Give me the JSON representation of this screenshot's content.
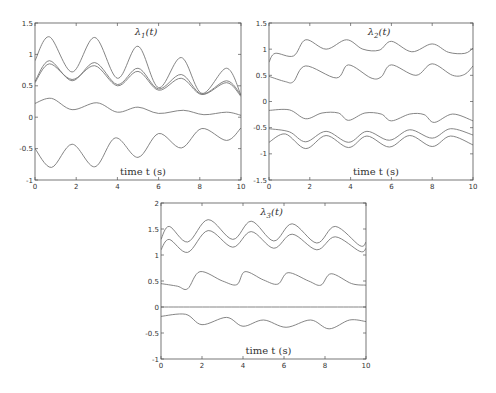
{
  "chart_data": [
    {
      "id": "lambda1",
      "type": "line",
      "title": "λ1(t)",
      "title_main": "λ",
      "title_sub": "1",
      "title_tail": "(t)",
      "xlabel": "time t (s)",
      "ylabel": "",
      "xlim": [
        0,
        10
      ],
      "ylim": [
        -1,
        1.5
      ],
      "xticks": [
        0,
        2,
        4,
        6,
        8,
        10
      ],
      "yticks": [
        -1,
        -0.5,
        0,
        0.5,
        1,
        1.5
      ],
      "ytick_labels": [
        "-1",
        "-0.5",
        "0",
        "0.5",
        "1",
        "1.5"
      ],
      "grid": false,
      "box": {
        "x": 35,
        "y": 23,
        "w": 206,
        "h": 157
      },
      "series": [
        {
          "name": "curve1",
          "x": [
            0,
            0.7,
            1.8,
            2.9,
            4.0,
            5.0,
            6.0,
            7.1,
            8.1,
            9.3,
            10
          ],
          "y": [
            0.9,
            1.28,
            0.72,
            1.27,
            0.62,
            1.13,
            0.47,
            0.95,
            0.38,
            0.78,
            0.35
          ]
        },
        {
          "name": "curve2",
          "x": [
            0,
            0.7,
            1.8,
            2.9,
            4.0,
            5.0,
            6.0,
            7.1,
            8.1,
            9.3,
            10
          ],
          "y": [
            0.57,
            0.9,
            0.58,
            0.87,
            0.52,
            0.78,
            0.45,
            0.68,
            0.37,
            0.58,
            0.35
          ]
        },
        {
          "name": "curve3",
          "x": [
            0,
            0.7,
            1.8,
            2.9,
            4.0,
            5.0,
            6.0,
            7.1,
            8.1,
            9.3,
            10
          ],
          "y": [
            0.55,
            0.85,
            0.6,
            0.82,
            0.5,
            0.73,
            0.43,
            0.62,
            0.36,
            0.55,
            0.33
          ]
        },
        {
          "name": "curve4",
          "x": [
            0,
            0.8,
            1.8,
            3.0,
            4.0,
            5.0,
            6.0,
            7.2,
            8.2,
            9.3,
            10
          ],
          "y": [
            0.22,
            0.3,
            0.12,
            0.23,
            0.08,
            0.16,
            0.06,
            0.11,
            0.04,
            0.08,
            0.03
          ]
        },
        {
          "name": "curve5",
          "x": [
            0,
            0.8,
            1.8,
            2.9,
            3.9,
            5.0,
            6.0,
            7.1,
            8.1,
            9.3,
            10
          ],
          "y": [
            -0.5,
            -0.8,
            -0.43,
            -0.79,
            -0.33,
            -0.64,
            -0.26,
            -0.49,
            -0.18,
            -0.37,
            -0.17
          ]
        }
      ]
    },
    {
      "id": "lambda2",
      "type": "line",
      "title": "λ2(t)",
      "title_main": "λ",
      "title_sub": "2",
      "title_tail": "(t)",
      "xlabel": "time t (s)",
      "ylabel": "",
      "xlim": [
        0,
        10
      ],
      "ylim": [
        -1.5,
        1.5
      ],
      "xticks": [
        0,
        2,
        4,
        6,
        8,
        10
      ],
      "yticks": [
        -1.5,
        -1,
        -0.5,
        0,
        0.5,
        1,
        1.5
      ],
      "ytick_labels": [
        "-1.5",
        "-1",
        "-0.5",
        "0",
        "0.5",
        "1",
        "1.5"
      ],
      "grid": false,
      "box": {
        "x": 269,
        "y": 23,
        "w": 204,
        "h": 157
      },
      "series": [
        {
          "name": "curve1",
          "x": [
            0,
            0.3,
            1.2,
            1.8,
            2.8,
            3.8,
            4.6,
            5.4,
            6.0,
            7.0,
            8.0,
            8.8,
            9.6,
            10
          ],
          "y": [
            0.75,
            0.92,
            0.87,
            1.18,
            1.0,
            1.18,
            1.0,
            0.98,
            1.15,
            0.95,
            1.1,
            0.94,
            0.92,
            1.02
          ]
        },
        {
          "name": "curve2",
          "x": [
            0,
            0.8,
            1.2,
            1.8,
            3.3,
            3.9,
            5.0,
            5.5,
            6.0,
            7.2,
            8.0,
            9.0,
            9.6,
            10
          ],
          "y": [
            0.48,
            0.38,
            0.38,
            0.68,
            0.45,
            0.7,
            0.45,
            0.47,
            0.7,
            0.5,
            0.72,
            0.5,
            0.52,
            0.68
          ]
        },
        {
          "name": "curve3",
          "x": [
            0,
            1.0,
            1.8,
            2.6,
            3.4,
            3.9,
            4.7,
            5.5,
            6.0,
            6.9,
            7.6,
            8.1,
            9.0,
            10
          ],
          "y": [
            -0.17,
            -0.16,
            -0.33,
            -0.22,
            -0.22,
            -0.36,
            -0.22,
            -0.24,
            -0.37,
            -0.24,
            -0.25,
            -0.4,
            -0.24,
            -0.37
          ]
        },
        {
          "name": "curve4",
          "x": [
            0,
            1.0,
            1.8,
            2.8,
            3.9,
            4.8,
            5.9,
            6.9,
            8.0,
            8.9,
            10
          ],
          "y": [
            -0.52,
            -0.58,
            -0.77,
            -0.57,
            -0.78,
            -0.57,
            -0.74,
            -0.54,
            -0.7,
            -0.52,
            -0.64
          ]
        },
        {
          "name": "curve5",
          "x": [
            0,
            0.8,
            1.8,
            2.8,
            3.9,
            4.8,
            5.9,
            6.9,
            8.0,
            8.9,
            10
          ],
          "y": [
            -0.78,
            -0.62,
            -0.9,
            -0.65,
            -0.88,
            -0.66,
            -0.87,
            -0.65,
            -0.86,
            -0.66,
            -0.83
          ]
        }
      ]
    },
    {
      "id": "lambda3",
      "type": "line",
      "title": "λ3(t)",
      "title_main": "λ",
      "title_sub": "3",
      "title_tail": "(t)",
      "xlabel": "time t (s)",
      "ylabel": "",
      "xlim": [
        0,
        10
      ],
      "ylim": [
        -1,
        2
      ],
      "xticks": [
        0,
        2,
        4,
        6,
        8,
        10
      ],
      "yticks": [
        -1,
        -0.5,
        0,
        0.5,
        1,
        1.5,
        2
      ],
      "ytick_labels": [
        "-1",
        "-0.5",
        "0",
        "0.5",
        "1",
        "1.5",
        "2"
      ],
      "grid": false,
      "box": {
        "x": 161,
        "y": 203,
        "w": 205,
        "h": 156
      },
      "series": [
        {
          "name": "curve1",
          "x": [
            0,
            0.4,
            1.3,
            2.3,
            3.5,
            4.4,
            5.5,
            6.4,
            7.6,
            8.5,
            9.7,
            10
          ],
          "y": [
            1.3,
            1.55,
            1.25,
            1.68,
            1.3,
            1.65,
            1.27,
            1.6,
            1.23,
            1.55,
            1.18,
            1.25
          ]
        },
        {
          "name": "curve2",
          "x": [
            0,
            0.4,
            1.3,
            2.3,
            3.5,
            4.4,
            5.5,
            6.4,
            7.6,
            8.5,
            9.7,
            10
          ],
          "y": [
            1.1,
            1.3,
            1.05,
            1.47,
            1.15,
            1.45,
            1.13,
            1.4,
            1.1,
            1.35,
            1.07,
            1.13
          ]
        },
        {
          "name": "curve3",
          "x": [
            0,
            0.8,
            1.3,
            1.9,
            3.0,
            3.7,
            4.1,
            5.0,
            5.7,
            6.2,
            7.2,
            7.8,
            8.3,
            9.3,
            10
          ],
          "y": [
            0.45,
            0.4,
            0.35,
            0.68,
            0.5,
            0.43,
            0.68,
            0.52,
            0.44,
            0.66,
            0.5,
            0.42,
            0.64,
            0.45,
            0.42
          ]
        },
        {
          "name": "curve4",
          "x": [
            0,
            10
          ],
          "y": [
            0.0,
            0.0
          ]
        },
        {
          "name": "curve5",
          "x": [
            0,
            1.2,
            2.0,
            3.2,
            4.0,
            5.0,
            6.1,
            7.3,
            8.2,
            9.2,
            10
          ],
          "y": [
            -0.18,
            -0.14,
            -0.34,
            -0.2,
            -0.37,
            -0.25,
            -0.39,
            -0.25,
            -0.42,
            -0.25,
            -0.28
          ]
        }
      ]
    }
  ],
  "colors": {
    "axes": "#555555",
    "line": "#777777",
    "text": "#333333"
  }
}
